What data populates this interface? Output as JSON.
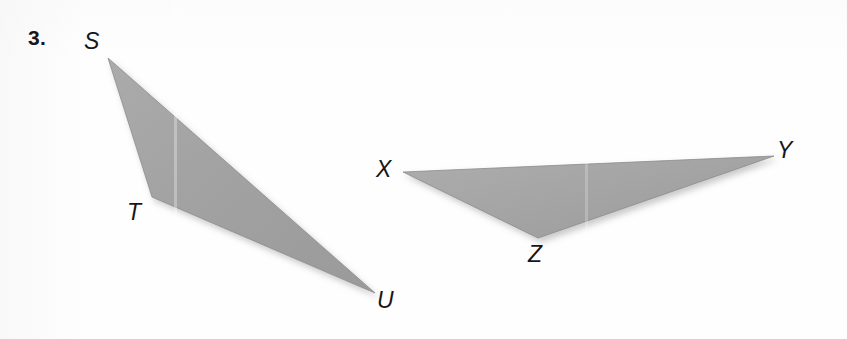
{
  "figure": {
    "problem_number": "3.",
    "background_color": "#fefefe",
    "fill_color": "#a3a3a3",
    "edge_color": "#8d8d8d",
    "shadow_color": "#c9c9c9",
    "label_color": "#16161a",
    "triangles": [
      {
        "name": "triangle-STU",
        "vertices": [
          {
            "label": "S",
            "x": 108,
            "y": 58
          },
          {
            "label": "T",
            "x": 152,
            "y": 197
          },
          {
            "label": "U",
            "x": 375,
            "y": 293
          }
        ],
        "points": "108,58 152,197 375,293"
      },
      {
        "name": "triangle-XYZ",
        "vertices": [
          {
            "label": "X",
            "x": 403,
            "y": 172
          },
          {
            "label": "Y",
            "x": 774,
            "y": 156
          },
          {
            "label": "Z",
            "x": 538,
            "y": 238
          }
        ],
        "points": "403,172 774,156 538,238"
      }
    ],
    "labels": {
      "S": "S",
      "T": "T",
      "U": "U",
      "X": "X",
      "Y": "Y",
      "Z": "Z"
    }
  }
}
